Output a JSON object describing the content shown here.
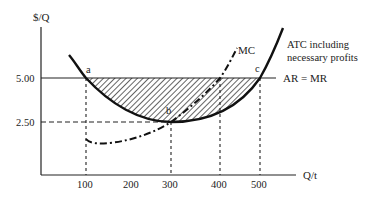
{
  "diagram": {
    "type": "economics-cost-curves",
    "y_axis_label": "$/Q",
    "x_axis_label": "Q/t",
    "y_ticks": [
      {
        "label": "5.00",
        "value": 5.0
      },
      {
        "label": "2.50",
        "value": 2.5
      }
    ],
    "x_ticks": [
      {
        "label": "100",
        "value": 100
      },
      {
        "label": "200",
        "value": 200
      },
      {
        "label": "300",
        "value": 300
      },
      {
        "label": "400",
        "value": 400
      },
      {
        "label": "500",
        "value": 500
      }
    ],
    "curves": {
      "atc": {
        "label_line1": "ATC including",
        "label_line2": "necessary profits"
      },
      "mc": {
        "label": "MC"
      },
      "demand": {
        "label": "AR = MR"
      }
    },
    "points": {
      "a": {
        "label": "a",
        "q": 100,
        "p": 5.0
      },
      "b": {
        "label": "b",
        "q": 300,
        "p": 2.5
      },
      "c": {
        "label": "c",
        "q": 500,
        "p": 5.0
      }
    },
    "shaded_region": "area between AR = MR and ATC from Q=100 to Q=500"
  }
}
